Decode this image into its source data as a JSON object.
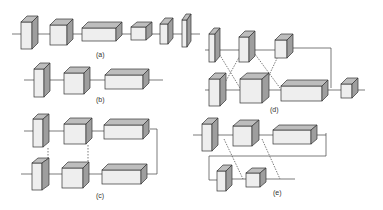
{
  "figure": {
    "panels": [
      {
        "id": "a",
        "label": "(a)",
        "description": "Sequential chain of six layer blocks"
      },
      {
        "id": "b",
        "label": "(b)",
        "description": "Sequential chain of three layer blocks"
      },
      {
        "id": "c",
        "label": "(c)",
        "description": "Two parallel three-block streams with loop-back from end of top stream to end of bottom stream and dotted vertical links"
      },
      {
        "id": "d",
        "label": "(d)",
        "description": "Two streams with crossing diagonal connections, merged into a final block"
      },
      {
        "id": "e",
        "label": "(e)",
        "description": "Top three-block stream looping back into a lower two-block stream with diagonal connections"
      }
    ],
    "colors": {
      "front": "#eeeeee",
      "top": "#bdbdbd",
      "side": "#9e9e9e",
      "stroke": "#333333",
      "line": "#444444"
    }
  }
}
